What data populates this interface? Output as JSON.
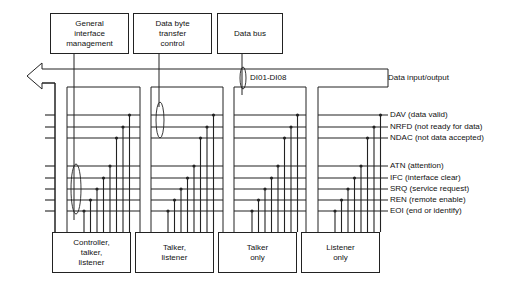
{
  "top_boxes": [
    {
      "label": "General\ninterface\nmanagement"
    },
    {
      "label": "Data byte\ntransfer\ncontrol"
    },
    {
      "label": "Data bus"
    }
  ],
  "bus": {
    "label": "DI01-DI08",
    "description": "Data input/output"
  },
  "signals": [
    {
      "name": "DAV (data valid)"
    },
    {
      "name": "NRFD (not ready for data)"
    },
    {
      "name": "NDAC (not data accepted)"
    },
    {
      "name": "ATN (attention)"
    },
    {
      "name": "IFC (interface clear)"
    },
    {
      "name": "SRQ (service request)"
    },
    {
      "name": "REN (remote enable)"
    },
    {
      "name": "EOI (end or identify)"
    }
  ],
  "devices": [
    {
      "label": "Controller,\ntalker,\nlistener"
    },
    {
      "label": "Talker,\nlistener"
    },
    {
      "label": "Talker\nonly"
    },
    {
      "label": "Listener\nonly"
    }
  ]
}
